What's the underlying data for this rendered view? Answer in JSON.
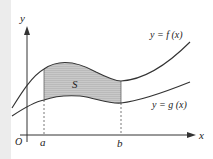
{
  "diagram": {
    "axes": {
      "x_label": "x",
      "y_label": "y",
      "origin_label": "O"
    },
    "ticks": {
      "a": "a",
      "b": "b"
    },
    "curves": {
      "upper": {
        "label": "y = f (x)"
      },
      "lower": {
        "label": "y = g (x)"
      }
    },
    "region": {
      "label": "S",
      "fill": "#c8c8c8"
    },
    "colors": {
      "stroke": "#333333",
      "background": "#ffffff",
      "strip": "#ececec"
    }
  }
}
